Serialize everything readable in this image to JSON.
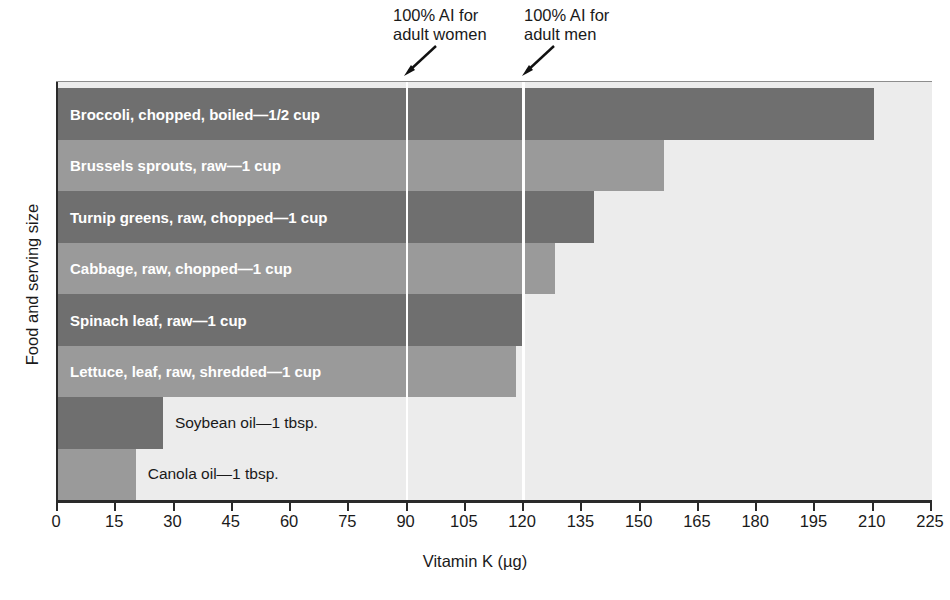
{
  "chart_data": {
    "type": "bar",
    "orientation": "horizontal",
    "title": "",
    "xlabel": "Vitamin K (µg)",
    "ylabel": "Food and serving size",
    "xlim": [
      0,
      225
    ],
    "xticks": [
      0,
      15,
      30,
      45,
      60,
      75,
      90,
      105,
      120,
      135,
      150,
      165,
      180,
      195,
      210,
      225
    ],
    "xtick_labels": [
      "0",
      "15",
      "30",
      "45",
      "60",
      "75",
      "90",
      "105",
      "120",
      "135",
      "150",
      "165",
      "180",
      "195",
      "210",
      "225"
    ],
    "grid": false,
    "legend": "none",
    "categories": [
      "Broccoli, chopped, boiled—1/2 cup",
      "Brussels sprouts, raw—1 cup",
      "Turnip greens, raw, chopped—1 cup",
      "Cabbage, raw, chopped—1 cup",
      "Spinach leaf, raw—1 cup",
      "Lettuce, leaf, raw, shredded—1 cup",
      "Soybean oil—1 tbsp.",
      "Canola oil—1 tbsp."
    ],
    "values": [
      210,
      156,
      138,
      128,
      120,
      118,
      27,
      20
    ],
    "bar_colors": [
      "#6f6f6f",
      "#9a9a9a",
      "#6f6f6f",
      "#9a9a9a",
      "#6f6f6f",
      "#9a9a9a",
      "#6f6f6f",
      "#9a9a9a"
    ],
    "label_inside": [
      true,
      true,
      true,
      true,
      true,
      true,
      false,
      false
    ],
    "annotations": [
      {
        "text": "100% AI for\nadult women",
        "value": 90
      },
      {
        "text": "100% AI for\nadult men",
        "value": 120
      }
    ],
    "reference_lines": [
      {
        "name": "adult-women-ai",
        "value": 90,
        "color": "#ffffff"
      },
      {
        "name": "adult-men-ai",
        "value": 120,
        "color": "#ffffff"
      }
    ]
  },
  "colors": {
    "bar_dark": "#6f6f6f",
    "bar_light": "#9a9a9a",
    "plot_background": "#ececec",
    "axis": "#2a2a2a",
    "reference_line": "#ffffff",
    "label_inside": "#ffffff",
    "label_outside": "#1a1a1a"
  }
}
